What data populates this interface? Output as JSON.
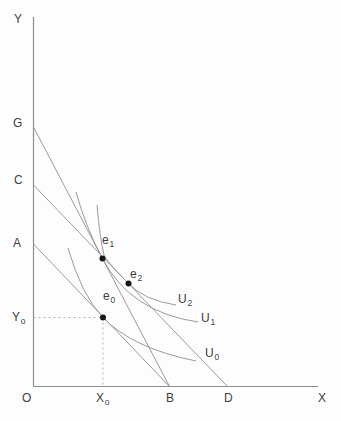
{
  "diagram": {
    "colors": {
      "background": "#fdfdfd",
      "line": "#9b9b9b",
      "axis": "#8f8f8f",
      "guide": "#b5b5b5",
      "dot": "#161616",
      "text": "#3d3d3d"
    },
    "axes": {
      "y_title": "Y",
      "x_title": "X",
      "origin": "O",
      "y_path": "M33.5 17 L33.5 386.5",
      "x_path": "M33.5 386.5 L318 386.5"
    },
    "y_axis_labels": [
      {
        "text": "G"
      },
      {
        "text": "C"
      },
      {
        "text": "A"
      },
      {
        "text": "Y",
        "sub": "o"
      }
    ],
    "x_axis_labels": [
      {
        "text": "X",
        "sub": "o"
      },
      {
        "text": "B"
      },
      {
        "text": "D"
      }
    ],
    "budget_lines": [
      {
        "name": "budget-line-GB",
        "from": "G",
        "to": "B",
        "d": "M33.5 127 L169.5 386.5"
      },
      {
        "name": "budget-line-CD",
        "from": "C",
        "to": "D",
        "d": "M33.5 185 L227.5 386.5"
      },
      {
        "name": "budget-line-AB",
        "from": "A",
        "to": "B",
        "d": "M33.5 244 L169.5 386.5"
      }
    ],
    "indifference_curves": [
      {
        "label": "U",
        "sub": "0",
        "d": "M68 248 Q81.4 295 103 317.5 Q132.5 348.3 196 361"
      },
      {
        "label": "U",
        "sub": "1",
        "d": "M76 192 Q86 228 102.5 258.5 Q130 312 198 322"
      },
      {
        "label": "U",
        "sub": "2",
        "d": "M97 205 Q99.8 238 104 255 Q105.2 259.8 128.5 283.5 Q144.3 300.3 176 305"
      }
    ],
    "equilibrium_points": [
      {
        "label": "e",
        "sub": "1",
        "cx": 102.5,
        "cy": 258.5
      },
      {
        "label": "e",
        "sub": "2",
        "cx": 128.5,
        "cy": 283.5
      },
      {
        "label": "e",
        "sub": "0",
        "cx": 103,
        "cy": 317.5
      }
    ],
    "guide_lines": [
      {
        "name": "guide-dashed-y0",
        "d": "M33.5 317.5 L103 317.5"
      },
      {
        "name": "guide-dashed-x0",
        "d": "M103 317.5 L103 386.5"
      }
    ],
    "dot_radius": 3
  }
}
